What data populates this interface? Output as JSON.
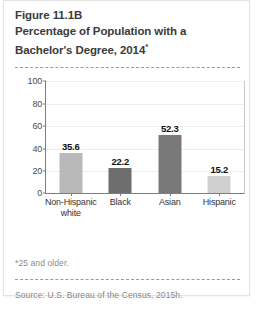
{
  "figure": {
    "title_line1": "Figure 11.1B",
    "title_line2": "Percentage of Population with a",
    "title_line3": "Bachelor's Degree, 2014",
    "title_asterisk": "*",
    "footnote": "*25 and older.",
    "source": "Source: U.S. Bureau of the Census, 2015h."
  },
  "chart_data": {
    "type": "bar",
    "title": "Figure 11.1B Percentage of Population with a Bachelor's Degree, 2014*",
    "categories": [
      "Non-Hispanic white",
      "Black",
      "Asian",
      "Hispanic"
    ],
    "category_lines": [
      [
        "Non-Hispanic",
        "white"
      ],
      [
        "Black"
      ],
      [
        "Asian"
      ],
      [
        "Hispanic"
      ]
    ],
    "values": [
      35.6,
      22.2,
      52.3,
      15.2
    ],
    "value_labels": [
      "35.6",
      "22.2",
      "52.3",
      "15.2"
    ],
    "bar_colors": [
      "#b9b9b9",
      "#6e6e6e",
      "#797979",
      "#cfcfcf"
    ],
    "xlabel": "",
    "ylabel": "",
    "ylim": [
      0,
      100
    ],
    "yticks": [
      0,
      20,
      40,
      60,
      80,
      100
    ],
    "ytick_labels": [
      "0",
      "20",
      "40",
      "60",
      "80",
      "100"
    ],
    "grid": true,
    "legend": "none"
  }
}
